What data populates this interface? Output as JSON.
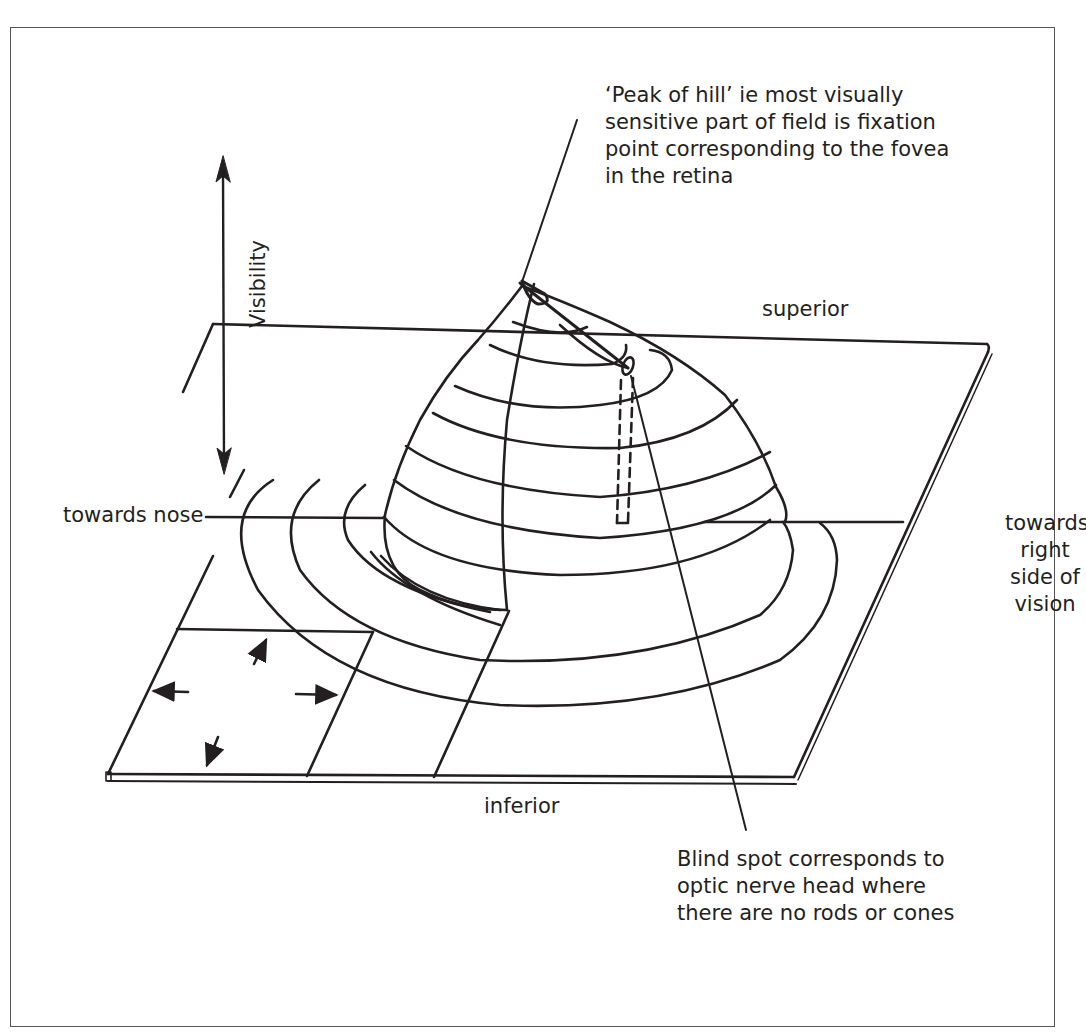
{
  "figure": {
    "type": "3D hill of vision diagram (right eye visual field)",
    "stroke_color": "#231f20",
    "background": "#ffffff"
  },
  "labels": {
    "visibility_axis": "Visibility",
    "peak_annotation": [
      "‘Peak of hill’ ie most visually",
      "sensitive part of field is fixation",
      "point corresponding to the fovea",
      "in the retina"
    ],
    "superior": "superior",
    "inferior": "inferior",
    "towards_nose": "towards nose",
    "towards_right": [
      "towards",
      "right",
      "side of",
      "vision"
    ],
    "blind_spot_annotation": [
      "Blind spot corresponds to",
      "optic nerve head where",
      "there are no rods or cones"
    ]
  },
  "elements": {
    "visibility_arrow": "double-headed vertical arrow",
    "inset_square_arrows": [
      "up",
      "left",
      "right",
      "down"
    ],
    "blind_spot_marker": "dashed vertical column under small ellipse on hill",
    "peak_marker": "small ellipse at summit"
  }
}
